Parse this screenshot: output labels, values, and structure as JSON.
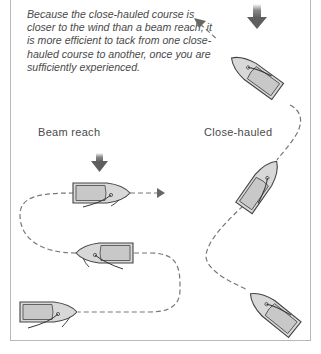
{
  "caption": "Because the close-hauled course is closer to the wind than a beam reach, it is more efficient to tack from one close-hauled course to another, once you are sufficiently experienced.",
  "labels": {
    "beam_reach": "Beam reach",
    "close_hauled": "Close-hauled"
  },
  "colors": {
    "frame": "#b8b8b8",
    "text": "#4a4a4a",
    "wind_arrow": "#666666",
    "hull_fill": "#cfcfcf",
    "hull_outline": "#555555",
    "course_line": "#777777"
  },
  "diagrams": [
    {
      "name": "beam-reach",
      "wind_direction": "down",
      "boats": 3,
      "course": "dashed path with arrowhead to the right"
    },
    {
      "name": "close-hauled",
      "wind_direction": "down",
      "boats": 3,
      "course": "dashed zigzag path with arrowhead to upper-left"
    }
  ]
}
